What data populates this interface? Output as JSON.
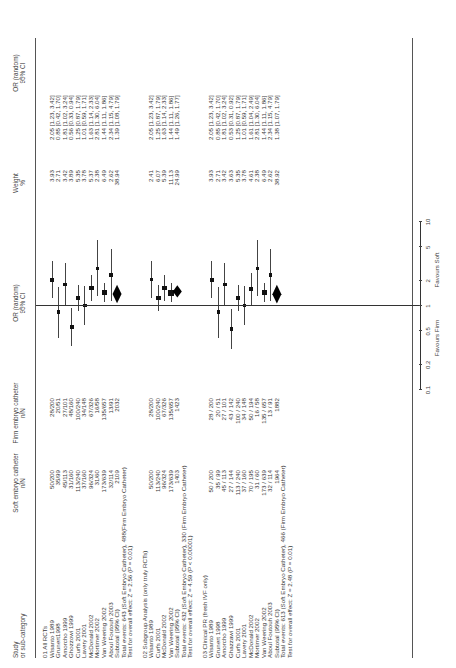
{
  "header": {
    "study": [
      "Study",
      "or sub-category"
    ],
    "soft": [
      "Soft embryo catheter",
      "n/N"
    ],
    "firm": [
      "Firm embryo catheter",
      "n/N"
    ],
    "or_plot": [
      "OR (random)",
      "95% CI"
    ],
    "weight": [
      "Weight",
      "%"
    ],
    "or_text": [
      "OR (random)",
      "95% CI"
    ]
  },
  "axis": {
    "ticks": [
      "0.1",
      "0.2",
      "0.5",
      "1",
      "2",
      "5",
      "10"
    ],
    "left_label": "Favours Firm",
    "right_label": "Favours Soft"
  },
  "sections": [
    {
      "title": "01 All RCTs",
      "rows": [
        {
          "study": "Wisanto 1989",
          "soft": "50/200",
          "firm": "28/200",
          "weight": "3.93",
          "or": "2.05 [1.23, 3.42]"
        },
        {
          "study": "Grunert1998",
          "soft": "35/99",
          "firm": "20/51",
          "weight": "2.71",
          "or": "0.85 [0.42, 1.70]"
        },
        {
          "study": "Amorcho 1999",
          "soft": "45/113",
          "firm": "27/101",
          "weight": "3.42",
          "or": "1.81 [1.02, 3.24]"
        },
        {
          "study": "Ghozzowi 1999",
          "soft": "31/160",
          "firm": "48/160",
          "weight": "3.89",
          "or": "0.56 [0.33, 0.94]"
        },
        {
          "study": "Curfs 2001",
          "soft": "113/240",
          "firm": "100/240",
          "weight": "5.35",
          "or": "1.25 [0.87, 1.79]"
        },
        {
          "study": "Lavery 2001",
          "soft": "37/160",
          "firm": "34/148",
          "weight": "3.78",
          "or": "1.01 [0.59, 1.71]"
        },
        {
          "study": "McDonald 2002",
          "soft": "96/324",
          "firm": "67/326",
          "weight": "5.37",
          "or": "1.63 [1.14, 2.33]"
        },
        {
          "study": "Mortimer 2002",
          "soft": "31/60",
          "firm": "16/58",
          "weight": "2.38",
          "or": "2.81 [1.30, 6.04]"
        },
        {
          "study": "Van Weering 2002",
          "soft": "173/639",
          "firm": "135/657",
          "weight": "6.49",
          "or": "1.44 [1.11, 1.86]"
        },
        {
          "study": "Aboul Foutouh 2003",
          "soft": "32/114",
          "firm": "13/91",
          "weight": "2.62",
          "or": "2.34 [1.15, 4.79]"
        }
      ],
      "subtotal": {
        "label": "Subtotal (95% CI)",
        "soft": "2109",
        "firm": "2032",
        "weight": "38.94",
        "or": "1.39 [1.08, 1.79]"
      },
      "total_events": "Total events: 643 (Soft Embryo Catheter), 488(Firm Embryo Catheter)",
      "test": "Test for overall effect: Z = 2.56 (P = 0.01)"
    },
    {
      "title": "02 Subgroup Analysis (only truly RCTs)",
      "rows": [
        {
          "study": "Wisanto 1989",
          "soft": "50/200",
          "firm": "28/200",
          "weight": "2.41",
          "or": "2.05 [1.23, 3.42]"
        },
        {
          "study": "Curfs 2001",
          "soft": "113/240",
          "firm": "100/240",
          "weight": "6.07",
          "or": "1.25 [0.87, 1.79]"
        },
        {
          "study": "McDonald 2002",
          "soft": "96/324",
          "firm": "67/326",
          "weight": "5.39",
          "or": "1.63 [1.14, 2.33]"
        },
        {
          "study": "Van Weering 2002",
          "soft": "173/639",
          "firm": "135/657",
          "weight": "11.13",
          "or": "1.44 [1.11, 1.86]"
        }
      ],
      "subtotal": {
        "label": "Subtotal (95% CI)",
        "soft": "1403",
        "firm": "1423",
        "weight": "24.99",
        "or": "1.49 [1.26, 1.77]"
      },
      "total_events": "Total events: 432 (Soft Embryo Catheter), 330 (Firm Embryo Catheter)",
      "test": "Test for overall effect: Z = 4.59 (P < 0.00001)"
    },
    {
      "title": "03 Clinical PR (fresh IVF only)",
      "rows": [
        {
          "study": "Wisanto 1989",
          "soft": "50 / 200",
          "firm": "28 / 200",
          "weight": "3.93",
          "or": "2.05 [1.23, 3.42]"
        },
        {
          "study": "Grunert 1998",
          "soft": "35 / 99",
          "firm": "20 / 51",
          "weight": "2.71",
          "or": "0.85 [0.42, 1.70]"
        },
        {
          "study": "Amorcho 1999",
          "soft": "45 / 113",
          "firm": "27 / 101",
          "weight": "3.42",
          "or": "1.81 [1.02, 3.24]"
        },
        {
          "study": "Ghazzawi 1999",
          "soft": "27 / 144",
          "firm": "43 / 142",
          "weight": "3.63",
          "or": "0.53 [0.31, 0.92]"
        },
        {
          "study": "Curfs 2001",
          "soft": "113 / 240",
          "firm": "100 / 240",
          "weight": "5.35",
          "or": "1.25 [0.87, 1.79]"
        },
        {
          "study": "Lavery 2001",
          "soft": "37 / 160",
          "firm": "34 / 148",
          "weight": "3.78",
          "or": "1.01 [0.59, 1.71]"
        },
        {
          "study": "McDonald 2002",
          "soft": "70 / 195",
          "firm": "50 / 194",
          "weight": "4.61",
          "or": "1.61 [1.04, 2.49]"
        },
        {
          "study": "Mortimer 2002",
          "soft": "31 / 60",
          "firm": "16 / 58",
          "weight": "2.38",
          "or": "2.81 [1.30, 6.04]"
        },
        {
          "study": "Van Weering 2002",
          "soft": "173 / 639",
          "firm": "135 / 657",
          "weight": "6.49",
          "or": "1.44 [1.11, 1.86]"
        },
        {
          "study": "Aboul Foutouh 2003",
          "soft": "32 / 114",
          "firm": "13 / 91",
          "weight": "2.62",
          "or": "2.34 [1.15, 4.79]"
        }
      ],
      "subtotal": {
        "label": "Subtotal (95% CI)",
        "soft": "1964",
        "firm": "1882",
        "weight": "38.92",
        "or": "1.38 [1.07, 1.79]"
      },
      "total_events": "Total events: 613 (Soft Embryo Catheter), 466 (Firm Embryo Catheter)",
      "test": "Test for overall effect: Z = 2.48 (P = 0.01)"
    }
  ],
  "chart_data": {
    "type": "forest",
    "title": "",
    "orientation": "rotated 90 degrees counter-clockwise",
    "xlabel": "OR (random) 95% CI",
    "x_scale": "log",
    "xlim": [
      0.1,
      10
    ],
    "x_ticks": [
      0.1,
      0.2,
      0.5,
      1,
      2,
      5,
      10
    ],
    "reference_line": 1,
    "annotations": [
      "Favours Firm",
      "Favours Soft"
    ],
    "series": [
      {
        "name": "01 All RCTs",
        "studies": [
          "Wisanto 1989",
          "Grunert1998",
          "Amorcho 1999",
          "Ghozzowi 1999",
          "Curfs 2001",
          "Lavery 2001",
          "McDonald 2002",
          "Mortimer 2002",
          "Van Weering 2002",
          "Aboul Foutouh 2003"
        ],
        "or": [
          2.05,
          0.85,
          1.81,
          0.56,
          1.25,
          1.01,
          1.63,
          2.81,
          1.44,
          2.34
        ],
        "ci_low": [
          1.23,
          0.42,
          1.02,
          0.33,
          0.87,
          0.59,
          1.14,
          1.3,
          1.11,
          1.15
        ],
        "ci_high": [
          3.42,
          1.7,
          3.24,
          0.94,
          1.79,
          1.71,
          2.33,
          6.04,
          1.86,
          4.79
        ],
        "weight": [
          3.93,
          2.71,
          3.42,
          3.89,
          5.35,
          3.78,
          5.37,
          2.38,
          6.49,
          2.62
        ],
        "subtotal": {
          "or": 1.39,
          "ci_low": 1.08,
          "ci_high": 1.79,
          "weight": 38.94,
          "n_soft": 2109,
          "n_firm": 2032
        }
      },
      {
        "name": "02 Subgroup Analysis (only truly RCTs)",
        "studies": [
          "Wisanto 1989",
          "Curfs 2001",
          "McDonald 2002",
          "Van Weering 2002"
        ],
        "or": [
          2.05,
          1.25,
          1.63,
          1.44
        ],
        "ci_low": [
          1.23,
          0.87,
          1.14,
          1.11
        ],
        "ci_high": [
          3.42,
          1.79,
          2.33,
          1.86
        ],
        "weight": [
          2.41,
          6.07,
          5.39,
          11.13
        ],
        "subtotal": {
          "or": 1.49,
          "ci_low": 1.26,
          "ci_high": 1.77,
          "weight": 24.99,
          "n_soft": 1403,
          "n_firm": 1423
        }
      },
      {
        "name": "03 Clinical PR (fresh IVF only)",
        "studies": [
          "Wisanto 1989",
          "Grunert 1998",
          "Amorcho 1999",
          "Ghazzawi 1999",
          "Curfs 2001",
          "Lavery 2001",
          "McDonald 2002",
          "Mortimer 2002",
          "Van Weering 2002",
          "Aboul Foutouh 2003"
        ],
        "or": [
          2.05,
          0.85,
          1.81,
          0.53,
          1.25,
          1.01,
          1.61,
          2.81,
          1.44,
          2.34
        ],
        "ci_low": [
          1.23,
          0.42,
          1.02,
          0.31,
          0.87,
          0.59,
          1.04,
          1.3,
          1.11,
          1.15
        ],
        "ci_high": [
          3.42,
          1.7,
          3.24,
          0.92,
          1.79,
          1.71,
          2.49,
          6.04,
          1.86,
          4.79
        ],
        "weight": [
          3.93,
          2.71,
          3.42,
          3.63,
          5.35,
          3.78,
          4.61,
          2.38,
          6.49,
          2.62
        ],
        "subtotal": {
          "or": 1.38,
          "ci_low": 1.07,
          "ci_high": 1.79,
          "weight": 38.92,
          "n_soft": 1964,
          "n_firm": 1882
        }
      }
    ]
  }
}
